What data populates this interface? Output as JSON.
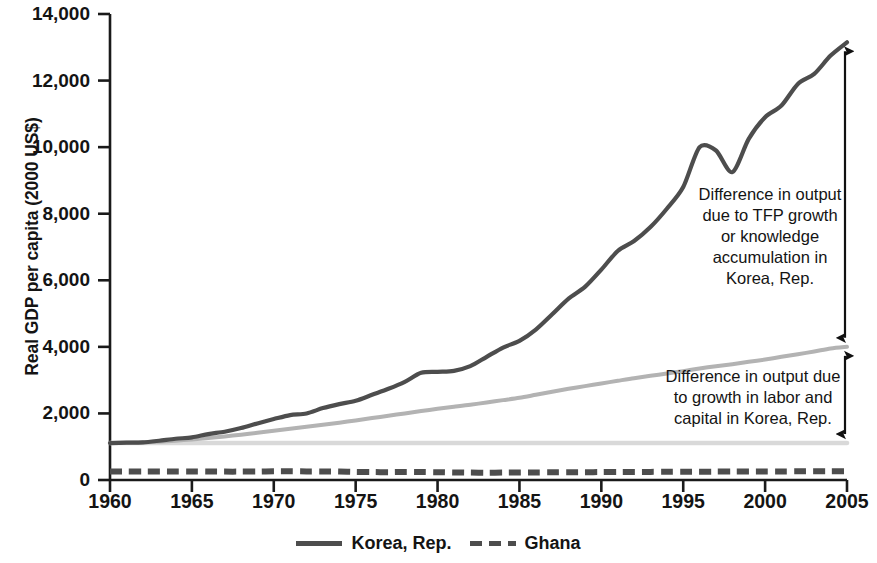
{
  "chart_data": {
    "type": "line",
    "title": "",
    "xlabel": "",
    "ylabel": "Real GDP per capita (2000 US$)",
    "xlim": [
      1960,
      2005
    ],
    "ylim": [
      0,
      14000
    ],
    "grid": false,
    "legend_position": "bottom",
    "xticks": [
      1960,
      1965,
      1970,
      1975,
      1980,
      1985,
      1990,
      1995,
      2000,
      2005
    ],
    "xtick_labels": [
      "1960",
      "1965",
      "1970",
      "1975",
      "1980",
      "1985",
      "1990",
      "1995",
      "2000",
      "2005"
    ],
    "yticks": [
      0,
      2000,
      4000,
      6000,
      8000,
      10000,
      12000,
      14000
    ],
    "ytick_labels": [
      "0",
      "2,000",
      "4,000",
      "6,000",
      "8,000",
      "10,000",
      "12,000",
      "14,000"
    ],
    "x": [
      1960,
      1961,
      1962,
      1963,
      1964,
      1965,
      1966,
      1967,
      1968,
      1969,
      1970,
      1971,
      1972,
      1973,
      1974,
      1975,
      1976,
      1977,
      1978,
      1979,
      1980,
      1981,
      1982,
      1983,
      1984,
      1985,
      1986,
      1987,
      1988,
      1989,
      1990,
      1991,
      1992,
      1993,
      1994,
      1995,
      1996,
      1997,
      1998,
      1999,
      2000,
      2001,
      2002,
      2003,
      2004,
      2005
    ],
    "series": [
      {
        "name": "Korea, Rep.",
        "style": "solid",
        "color": "#4d4d4d",
        "values": [
          1110,
          1120,
          1130,
          1180,
          1240,
          1280,
          1380,
          1450,
          1560,
          1700,
          1830,
          1950,
          2000,
          2160,
          2280,
          2380,
          2560,
          2740,
          2950,
          3220,
          3250,
          3280,
          3420,
          3700,
          3980,
          4180,
          4520,
          4980,
          5450,
          5800,
          6320,
          6880,
          7180,
          7600,
          8150,
          8800,
          10000,
          9900,
          9250,
          10250,
          10900,
          11250,
          11900,
          12200,
          12750,
          13150
        ]
      },
      {
        "name": "Korea, Rep. output due to labor and capital growth",
        "style": "solid",
        "color": "#b3b3b3",
        "values": [
          1110,
          1120,
          1130,
          1150,
          1180,
          1220,
          1260,
          1310,
          1360,
          1420,
          1480,
          1540,
          1600,
          1660,
          1720,
          1790,
          1860,
          1930,
          2000,
          2070,
          2140,
          2200,
          2260,
          2330,
          2400,
          2470,
          2560,
          2650,
          2740,
          2820,
          2900,
          2980,
          3060,
          3130,
          3200,
          3270,
          3350,
          3420,
          3480,
          3550,
          3620,
          3700,
          3780,
          3860,
          3950,
          4000
        ]
      },
      {
        "name": "Korea, Rep. baseline 1960 output level",
        "style": "solid",
        "color": "#d9d9d9",
        "values": [
          1110,
          1110,
          1110,
          1110,
          1110,
          1110,
          1110,
          1110,
          1110,
          1110,
          1110,
          1110,
          1110,
          1110,
          1110,
          1110,
          1110,
          1110,
          1110,
          1110,
          1110,
          1110,
          1110,
          1110,
          1110,
          1110,
          1110,
          1110,
          1110,
          1110,
          1110,
          1110,
          1110,
          1110,
          1110,
          1110,
          1110,
          1110,
          1110,
          1110,
          1110,
          1110,
          1110,
          1110,
          1110,
          1110
        ]
      },
      {
        "name": "Ghana",
        "style": "dashed",
        "color": "#4d4d4d",
        "values": [
          255,
          255,
          255,
          258,
          258,
          258,
          255,
          252,
          252,
          255,
          262,
          262,
          258,
          258,
          252,
          242,
          238,
          235,
          240,
          238,
          235,
          228,
          222,
          218,
          222,
          225,
          228,
          230,
          232,
          235,
          238,
          240,
          242,
          244,
          246,
          248,
          250,
          252,
          254,
          256,
          258,
          258,
          260,
          262,
          264,
          266
        ]
      }
    ],
    "annotations": [
      {
        "id": "tfp",
        "text": "Difference in output due to TFP growth or knowledge accumulation in Korea, Rep.",
        "arrow": "double-headed vertical",
        "from_value": 4000,
        "to_value": 13150
      },
      {
        "id": "labor",
        "text": "Difference in output due to growth in labor and capital in Korea, Rep.",
        "arrow": "double-headed vertical",
        "from_value": 1110,
        "to_value": 4000
      }
    ]
  },
  "legend": {
    "items": [
      {
        "label": "Korea, Rep."
      },
      {
        "label": "Ghana"
      }
    ]
  }
}
